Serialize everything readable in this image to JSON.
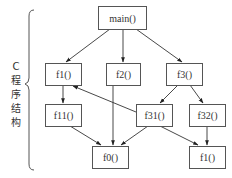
{
  "side_label": {
    "chars": [
      "C",
      "程",
      "序",
      "结",
      "构"
    ],
    "text": "C程序结构"
  },
  "nodes": {
    "main": {
      "label": "main()"
    },
    "f1": {
      "label": "f1()"
    },
    "f2": {
      "label": "f2()"
    },
    "f3": {
      "label": "f3()"
    },
    "f11": {
      "label": "f11()"
    },
    "f31": {
      "label": "f31()"
    },
    "f32": {
      "label": "f32()"
    },
    "f0": {
      "label": "f0()"
    },
    "f1_bottom": {
      "label": "f1()"
    }
  },
  "edges": [
    {
      "from": "main()",
      "to": "f1()"
    },
    {
      "from": "main()",
      "to": "f2()"
    },
    {
      "from": "main()",
      "to": "f3()"
    },
    {
      "from": "f1()",
      "to": "f11()"
    },
    {
      "from": "f3()",
      "to": "f31()"
    },
    {
      "from": "f3()",
      "to": "f32()"
    },
    {
      "from": "f31()",
      "to": "f1()"
    },
    {
      "from": "f11()",
      "to": "f0()"
    },
    {
      "from": "f2()",
      "to": "f0()"
    },
    {
      "from": "f31()",
      "to": "f0()"
    },
    {
      "from": "f31()",
      "to": "f1() (bottom)"
    },
    {
      "from": "f32()",
      "to": "f1() (bottom)"
    }
  ],
  "colors": {
    "line": "#333333",
    "box_border": "#555555",
    "background": "#ffffff"
  }
}
